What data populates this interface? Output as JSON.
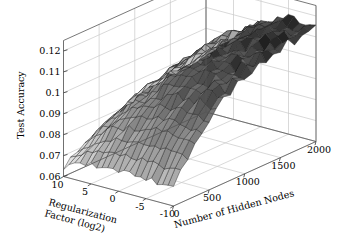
{
  "figure": {
    "title": "",
    "background_color": "#ffffff",
    "width": 344,
    "height": 251
  },
  "chart_data": {
    "type": "surface",
    "title": "",
    "subtitle": "",
    "projection": "3d",
    "grid": true,
    "legend": null,
    "legend_position": "none",
    "surface_colormap": "gray",
    "mesh_color": "#141414",
    "axes": {
      "x": {
        "label": "Number of Hidden Nodes",
        "ticks": [
          0,
          500,
          1000,
          1500,
          2000
        ],
        "tick_labels": [
          "0",
          "500",
          "1000",
          "1500",
          "2000"
        ],
        "range": [
          0,
          2000
        ]
      },
      "y": {
        "label": "Regularization Factor (log2)",
        "ticks": [
          10,
          5,
          0,
          -5,
          -10
        ],
        "tick_labels": [
          "10",
          "5",
          "0",
          "-5",
          "-10"
        ],
        "range": [
          -10,
          10
        ]
      },
      "z": {
        "label": "Test Accuracy",
        "ticks": [
          0.06,
          0.07,
          0.08,
          0.09,
          0.1,
          0.11,
          0.12
        ],
        "tick_labels": [
          "0.06",
          "0.07",
          "0.08",
          "0.09",
          "0.1",
          "0.11",
          "0.12"
        ],
        "range": [
          0.06,
          0.125
        ]
      }
    },
    "z_min_observed": 0.062,
    "z_max_observed": 0.124,
    "grid_nx": 21,
    "grid_ny": 21,
    "z_values": [
      [
        0.064,
        0.0668,
        0.069,
        0.0712,
        0.0735,
        0.0752,
        0.077,
        0.0786,
        0.08,
        0.0814,
        0.0825,
        0.0834,
        0.0842,
        0.0848,
        0.0853,
        0.0857,
        0.086,
        0.0862,
        0.0863,
        0.0864,
        0.0864
      ],
      [
        0.0655,
        0.0686,
        0.0712,
        0.0737,
        0.076,
        0.078,
        0.0798,
        0.0814,
        0.0828,
        0.084,
        0.0851,
        0.086,
        0.0867,
        0.0873,
        0.0878,
        0.0881,
        0.0884,
        0.0886,
        0.0887,
        0.0888,
        0.0888
      ],
      [
        0.0668,
        0.0702,
        0.0732,
        0.076,
        0.0784,
        0.0806,
        0.0825,
        0.0842,
        0.0856,
        0.0869,
        0.088,
        0.0889,
        0.0896,
        0.0902,
        0.0907,
        0.091,
        0.0913,
        0.0915,
        0.0916,
        0.0917,
        0.0917
      ],
      [
        0.0678,
        0.0716,
        0.075,
        0.078,
        0.0806,
        0.083,
        0.085,
        0.0868,
        0.0883,
        0.0896,
        0.0907,
        0.0917,
        0.0924,
        0.093,
        0.0935,
        0.0939,
        0.0942,
        0.0944,
        0.0945,
        0.0946,
        0.0946
      ],
      [
        0.0686,
        0.0728,
        0.0765,
        0.0798,
        0.0827,
        0.0852,
        0.0874,
        0.0893,
        0.0909,
        0.0923,
        0.0934,
        0.0944,
        0.0952,
        0.0958,
        0.0963,
        0.0967,
        0.097,
        0.0972,
        0.0973,
        0.0974,
        0.0975
      ],
      [
        0.0692,
        0.0738,
        0.0778,
        0.0814,
        0.0845,
        0.0872,
        0.0896,
        0.0916,
        0.0933,
        0.0947,
        0.0959,
        0.0969,
        0.0978,
        0.0985,
        0.099,
        0.0994,
        0.0997,
        0.0999,
        0.1001,
        0.1002,
        0.1003
      ],
      [
        0.0696,
        0.0745,
        0.0789,
        0.0827,
        0.0861,
        0.089,
        0.0915,
        0.0937,
        0.0955,
        0.097,
        0.0983,
        0.0994,
        0.1003,
        0.101,
        0.1016,
        0.102,
        0.1024,
        0.1026,
        0.1028,
        0.1029,
        0.103
      ],
      [
        0.0698,
        0.0751,
        0.0797,
        0.0838,
        0.0874,
        0.0905,
        0.0932,
        0.0955,
        0.0974,
        0.099,
        0.1004,
        0.1016,
        0.1025,
        0.1033,
        0.1039,
        0.1044,
        0.1048,
        0.105,
        0.1052,
        0.1054,
        0.1055
      ],
      [
        0.0699,
        0.0754,
        0.0803,
        0.0847,
        0.0885,
        0.0918,
        0.0946,
        0.097,
        0.0991,
        0.1008,
        0.1023,
        0.1035,
        0.1045,
        0.1053,
        0.106,
        0.1065,
        0.1069,
        0.1072,
        0.1074,
        0.1076,
        0.1077
      ],
      [
        0.0699,
        0.0757,
        0.0808,
        0.0853,
        0.0893,
        0.0928,
        0.0958,
        0.0983,
        0.1005,
        0.1023,
        0.1038,
        0.1051,
        0.1062,
        0.107,
        0.1077,
        0.1083,
        0.1087,
        0.109,
        0.1093,
        0.1095,
        0.1096
      ],
      [
        0.0698,
        0.0758,
        0.0811,
        0.0858,
        0.09,
        0.0936,
        0.0967,
        0.0993,
        0.1016,
        0.1035,
        0.1051,
        0.1064,
        0.1075,
        0.1084,
        0.1091,
        0.1097,
        0.1102,
        0.1105,
        0.1108,
        0.111,
        0.1112
      ],
      [
        0.0697,
        0.0758,
        0.0813,
        0.0862,
        0.0904,
        0.0941,
        0.0974,
        0.1001,
        0.1024,
        0.1044,
        0.106,
        0.1074,
        0.1085,
        0.1095,
        0.1102,
        0.1108,
        0.1113,
        0.1117,
        0.112,
        0.1122,
        0.1124
      ],
      [
        0.0696,
        0.0758,
        0.0814,
        0.0864,
        0.0907,
        0.0945,
        0.0978,
        0.1006,
        0.103,
        0.105,
        0.1067,
        0.1081,
        0.1093,
        0.1102,
        0.111,
        0.1117,
        0.1122,
        0.1126,
        0.1129,
        0.1131,
        0.1133
      ],
      [
        0.0695,
        0.0757,
        0.0814,
        0.0864,
        0.0909,
        0.0947,
        0.0981,
        0.1009,
        0.1033,
        0.1054,
        0.1071,
        0.1085,
        0.1097,
        0.1107,
        0.1115,
        0.1122,
        0.1127,
        0.1131,
        0.1135,
        0.1137,
        0.1139
      ],
      [
        0.0694,
        0.0756,
        0.0813,
        0.0864,
        0.0909,
        0.0948,
        0.0982,
        0.1011,
        0.1035,
        0.1056,
        0.1073,
        0.1088,
        0.11,
        0.111,
        0.1118,
        0.1125,
        0.113,
        0.1135,
        0.1138,
        0.1141,
        0.1143
      ],
      [
        0.0693,
        0.0755,
        0.0812,
        0.0863,
        0.0908,
        0.0947,
        0.0981,
        0.101,
        0.1035,
        0.1056,
        0.1074,
        0.1088,
        0.11,
        0.111,
        0.1119,
        0.1126,
        0.1131,
        0.1136,
        0.1139,
        0.1142,
        0.1144
      ],
      [
        0.0692,
        0.0754,
        0.0811,
        0.0862,
        0.0907,
        0.0946,
        0.098,
        0.1009,
        0.1034,
        0.1055,
        0.1073,
        0.1087,
        0.11,
        0.111,
        0.1118,
        0.1125,
        0.1131,
        0.1135,
        0.1139,
        0.1142,
        0.1144
      ],
      [
        0.0691,
        0.0752,
        0.0809,
        0.086,
        0.0905,
        0.0944,
        0.0978,
        0.1007,
        0.1032,
        0.1053,
        0.1071,
        0.1086,
        0.1098,
        0.1108,
        0.1117,
        0.1124,
        0.113,
        0.1134,
        0.1138,
        0.1141,
        0.1143
      ],
      [
        0.069,
        0.0751,
        0.0808,
        0.0858,
        0.0903,
        0.0942,
        0.0976,
        0.1005,
        0.103,
        0.1051,
        0.1069,
        0.1084,
        0.1096,
        0.1106,
        0.1115,
        0.1122,
        0.1128,
        0.1133,
        0.1137,
        0.114,
        0.1142
      ],
      [
        0.0689,
        0.075,
        0.0806,
        0.0856,
        0.0901,
        0.094,
        0.0974,
        0.1003,
        0.1028,
        0.1049,
        0.1067,
        0.1082,
        0.1095,
        0.1105,
        0.1114,
        0.1121,
        0.1127,
        0.1132,
        0.1136,
        0.1139,
        0.1141
      ],
      [
        0.0688,
        0.0749,
        0.0805,
        0.0855,
        0.09,
        0.0939,
        0.0973,
        0.1002,
        0.1027,
        0.1048,
        0.1066,
        0.1081,
        0.1094,
        0.1104,
        0.1113,
        0.112,
        0.1126,
        0.1131,
        0.1135,
        0.1138,
        0.114
      ]
    ]
  }
}
